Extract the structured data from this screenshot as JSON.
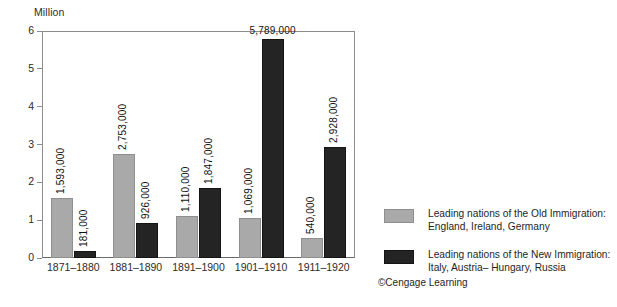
{
  "chart_data": {
    "type": "bar",
    "title": "",
    "subtitle": "",
    "xlabel": "",
    "ylabel": "Million",
    "ylim": [
      0,
      6
    ],
    "yticks": [
      0,
      1,
      2,
      3,
      4,
      5,
      6
    ],
    "ytick_labels": [
      "0",
      "1",
      "2",
      "3",
      "4",
      "5",
      "6"
    ],
    "grid": false,
    "legend_position": "right",
    "categories": [
      "1871–1880",
      "1881–1890",
      "1891–1900",
      "1901–1910",
      "1911–1920"
    ],
    "series": [
      {
        "name": "Leading nations of the Old Immigration: England, Ireland, Germany",
        "short_name": "Old Immigration",
        "color": "#a9a9a9",
        "values": [
          1.593,
          2.753,
          1.11,
          1.069,
          0.54
        ],
        "data_labels": [
          "1,593,000",
          "2,753,000",
          "1,110,000",
          "1,069,000",
          "540,000"
        ],
        "label_orientation": [
          "vertical",
          "vertical",
          "vertical",
          "vertical",
          "vertical"
        ]
      },
      {
        "name": "Leading nations of the New Immigration: Italy, Austria– Hungary, Russia",
        "short_name": "New Immigration",
        "color": "#242424",
        "values": [
          0.181,
          0.926,
          1.847,
          5.789,
          2.928
        ],
        "data_labels": [
          "181,000",
          "926,000",
          "1,847,000",
          "5,789,000",
          "2,928,000"
        ],
        "label_orientation": [
          "vertical",
          "vertical",
          "vertical",
          "horizontal",
          "vertical"
        ]
      }
    ]
  },
  "axis": {
    "unit_label": "Million"
  },
  "legend": {
    "items": [
      {
        "swatch": "old",
        "line1": "Leading nations of the Old Immigration:",
        "line2": "England, Ireland, Germany"
      },
      {
        "swatch": "new",
        "line1": "Leading nations of the New Immigration:",
        "line2": "Italy, Austria– Hungary, Russia"
      }
    ]
  },
  "credit": {
    "text": "©Cengage Learning"
  }
}
